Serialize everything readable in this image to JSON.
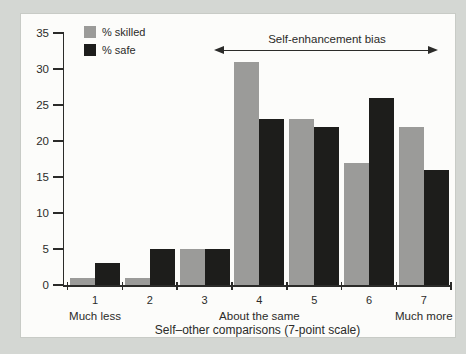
{
  "figure": {
    "background_color": "#d4d7d3",
    "panel_color": "#fcfcfa",
    "axis_color": "#2b2b29",
    "text_color": "#2b2b29"
  },
  "legend": {
    "items": [
      {
        "label": "% skilled",
        "color": "#9b9b99"
      },
      {
        "label": "% safe",
        "color": "#1d1d1b"
      }
    ]
  },
  "chart_data": {
    "type": "bar",
    "title": "",
    "categories": [
      "1",
      "2",
      "3",
      "4",
      "5",
      "6",
      "7"
    ],
    "category_sublabels": [
      "Much less",
      "",
      "",
      "About the same",
      "",
      "",
      "Much more"
    ],
    "series": [
      {
        "name": "% skilled",
        "color": "#9b9b99",
        "values": [
          1,
          1,
          5,
          31,
          23,
          17,
          22
        ]
      },
      {
        "name": "% safe",
        "color": "#1d1d1b",
        "values": [
          3,
          5,
          5,
          23,
          22,
          26,
          16
        ]
      }
    ],
    "xlabel": "Self–other comparisons (7-point scale)",
    "ylabel": "",
    "ylim": [
      0,
      35
    ],
    "yticks": [
      0,
      5,
      10,
      15,
      20,
      25,
      30,
      35
    ],
    "grid": false,
    "legend_position": "top-left",
    "annotation": {
      "text": "Self-enhancement bias",
      "arrow": "double-headed",
      "spans": "categories 4 to 7"
    }
  }
}
